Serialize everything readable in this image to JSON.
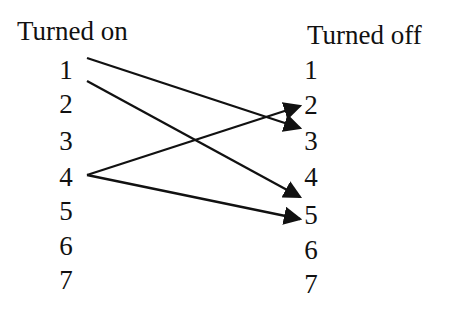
{
  "left_column": {
    "title": "Turned on",
    "items": [
      "1",
      "2",
      "3",
      "4",
      "5",
      "6",
      "7"
    ]
  },
  "right_column": {
    "title": "Turned off",
    "items": [
      "1",
      "2",
      "3",
      "4",
      "5",
      "6",
      "7"
    ]
  },
  "arrows": [
    {
      "from": "1",
      "to": "3"
    },
    {
      "from": "1",
      "to": "4"
    },
    {
      "from": "4",
      "to": "2"
    },
    {
      "from": "4",
      "to": "5"
    }
  ],
  "colors": {
    "line": "#111111",
    "background": "#ffffff"
  }
}
